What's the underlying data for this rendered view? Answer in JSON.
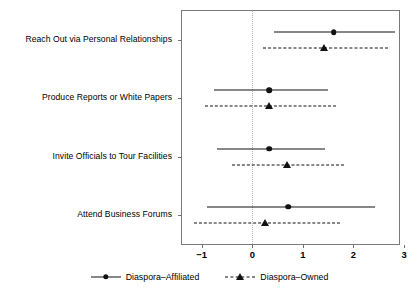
{
  "chart_data": {
    "type": "scatter",
    "title": "",
    "xlabel": "",
    "ylabel": "",
    "xlim": [
      -1.39,
      2.9
    ],
    "xticks": [
      -1,
      0,
      1,
      2,
      3
    ],
    "xticklabels": [
      "−1",
      "0",
      "1",
      "2",
      "3"
    ],
    "grid": false,
    "zero_reference_line": 0,
    "legend_position": "bottom",
    "categories": [
      "Reach Out via Personal Relationships",
      "Produce Reports or White Papers",
      "Invite Officials to Tour Facilities",
      "Attend Business Forums"
    ],
    "series": [
      {
        "name": "Diaspora–Affiliated",
        "marker": "circle",
        "linestyle": "solid",
        "color": "#111111",
        "estimates": [
          1.61,
          0.33,
          0.33,
          0.71
        ],
        "ci_low": [
          0.43,
          -0.75,
          -0.69,
          -0.9
        ],
        "ci_high": [
          2.82,
          1.49,
          1.43,
          2.43
        ]
      },
      {
        "name": "Diaspora–Owned",
        "marker": "triangle",
        "linestyle": "dashed",
        "color": "#111111",
        "estimates": [
          1.41,
          0.33,
          0.69,
          0.25
        ],
        "ci_low": [
          0.22,
          -0.94,
          -0.41,
          -1.16
        ],
        "ci_high": [
          2.69,
          1.65,
          1.82,
          1.73
        ]
      }
    ]
  },
  "legend": {
    "items": [
      {
        "label": "Diaspora–Affiliated",
        "marker": "circle",
        "linestyle": "solid"
      },
      {
        "label": "Diaspora–Owned",
        "marker": "triangle",
        "linestyle": "dashed"
      }
    ]
  },
  "colors": {
    "ink": "#111111",
    "frame": "#7a7a7a",
    "zeroline": "#b4b4b4",
    "background": "#ffffff"
  }
}
